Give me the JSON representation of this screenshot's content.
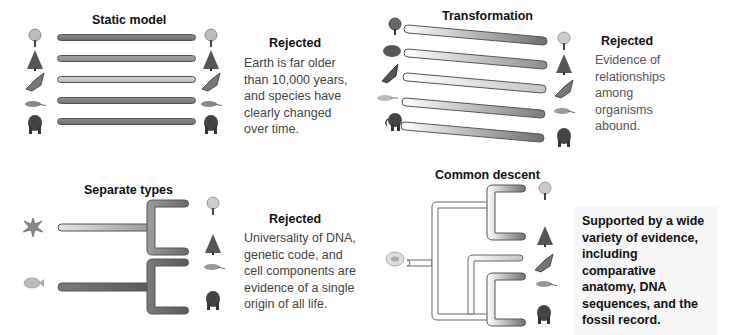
{
  "panels": {
    "static_model": {
      "title": "Static model",
      "verdict": "Rejected",
      "explanation": "Earth is far older\nthan 10,000 years,\nand species have\nclearly changed\nover time.",
      "organisms": [
        "flowering-plant",
        "conifer",
        "butterfly",
        "lizard",
        "gorilla"
      ]
    },
    "transformation": {
      "title": "Transformation",
      "verdict": "Rejected",
      "explanation": "Evidence of\nrelationships\namong\norganisms\nabound.",
      "start_organisms": [
        "flower",
        "shrub",
        "moth",
        "early-lizard",
        "mammoth"
      ],
      "end_organisms": [
        "flowering-plant",
        "conifer",
        "butterfly",
        "lizard",
        "gorilla"
      ]
    },
    "separate_types": {
      "title": "Separate types",
      "verdict": "Rejected",
      "explanation": "Universality of DNA,\ngenetic code, and\ncell components are\nevidence of a single\norigin of all life.",
      "ancestors": [
        "coral-plant",
        "fish"
      ],
      "organisms": [
        "flowering-plant",
        "conifer",
        "lizard",
        "gorilla"
      ]
    },
    "common_descent": {
      "title": "Common descent",
      "verdict": "",
      "explanation": "Supported by a wide\nvariety of evidence,\nincluding comparative\nanatomy, DNA\nsequences, and the\nfossil record.",
      "ancestor": "single-cell",
      "organisms": [
        "flowering-plant",
        "conifer",
        "butterfly",
        "lizard",
        "gorilla"
      ]
    }
  },
  "colors": {
    "bar_dark": "#7a7a7a",
    "bar_mid": "#9a9a9a",
    "bar_light": "#c8c8c8",
    "outline": "#555555",
    "support_bg": "#f6f6f6"
  }
}
